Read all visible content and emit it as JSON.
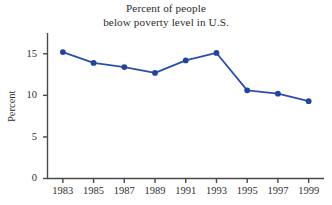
{
  "chart_data": {
    "type": "line",
    "title": "Percent of people below poverty level in U.S.",
    "title_lines": [
      "Percent of people",
      "below poverty level in U.S."
    ],
    "xlabel": "",
    "ylabel": "Percent",
    "categories": [
      "1983",
      "1985",
      "1987",
      "1989",
      "1991",
      "1993",
      "1995",
      "1997",
      "1999"
    ],
    "x": [
      1983,
      1985,
      1987,
      1989,
      1991,
      1993,
      1995,
      1997,
      1999
    ],
    "values": [
      15.2,
      13.9,
      13.4,
      12.7,
      14.2,
      15.1,
      10.6,
      10.2,
      9.3
    ],
    "series": [
      {
        "name": "Percent below poverty level",
        "values": [
          15.2,
          13.9,
          13.4,
          12.7,
          14.2,
          15.1,
          10.6,
          10.2,
          9.3
        ]
      }
    ],
    "ylim": [
      0,
      17.5
    ],
    "xlim": [
      1982,
      2000
    ],
    "yticks": [
      0,
      5,
      10,
      15
    ],
    "ytick_labels": [
      "0",
      "5",
      "10",
      "15"
    ],
    "xticks": [
      1983,
      1985,
      1987,
      1989,
      1991,
      1993,
      1995,
      1997,
      1999
    ],
    "xtick_labels": [
      "1983",
      "1985",
      "1987",
      "1989",
      "1991",
      "1993",
      "1995",
      "1997",
      "1999"
    ],
    "grid": false,
    "legend": false,
    "legend_position": "none",
    "marker": "circle",
    "line_color": "#2a4fad",
    "marker_color": "#24439b",
    "axis_color": "#4a4a4a",
    "background_color": "#ffffff",
    "text_color": "#2e2e2e"
  }
}
